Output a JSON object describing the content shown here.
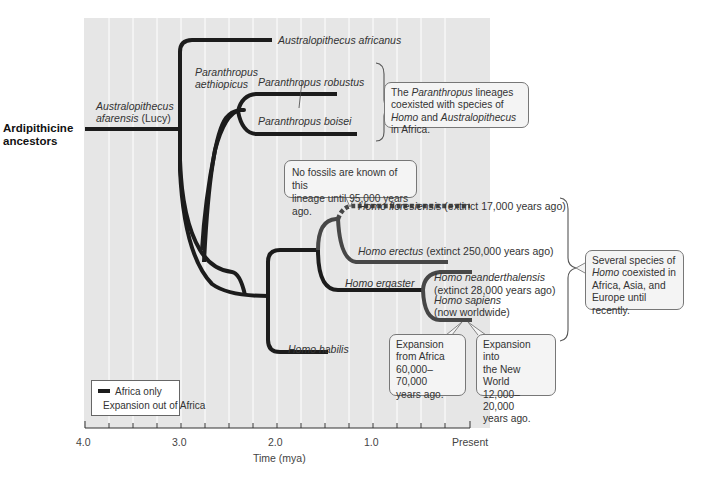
{
  "colors": {
    "background_panel": "#e6e6e6",
    "grid_line": "#ffffff",
    "africa_only": "#1c1c1c",
    "expansion_out_of_africa": "#474747",
    "callout_fill": "#f4f4f4",
    "callout_border": "#777777"
  },
  "root_label": {
    "line1": "Ardipithicine",
    "line2": "ancestors"
  },
  "taxa": {
    "afarensis": {
      "line1": "Australopithecus",
      "line2_italic": "afarensis",
      "line2_plain": " (Lucy)"
    },
    "africanus": "Australopithecus africanus",
    "aethiopicus": {
      "line1": "Paranthropus",
      "line2": "aethiopicus"
    },
    "robustus": "Paranthropus robustus",
    "boisei": "Paranthropus boisei",
    "floresiensis": {
      "name": "Homo floresiensis",
      "note": " (extinct 17,000 years ago)"
    },
    "erectus": {
      "name": "Homo erectus",
      "note": " (extinct 250,000 years ago)"
    },
    "neanderthalensis": {
      "name": "Homo neanderthalensis",
      "note": "(extinct 28,000 years ago)"
    },
    "ergaster": "Homo ergaster",
    "sapiens": {
      "name": "Homo sapiens",
      "note": "(now worldwide)"
    },
    "habilis": "Homo habilis"
  },
  "callouts": {
    "paranthropus": {
      "p1": "The ",
      "p1_it": "Paranthropus",
      "p2": " lineages coexisted with species of ",
      "p2_it": "Homo",
      "p3": " and ",
      "p3_it": "Australopithecus",
      "p4": " in Africa."
    },
    "no_fossils": {
      "line1": "No fossils are known of this",
      "line2": "lineage until 95,000 years ago."
    },
    "homo_coexist": {
      "p1": "Several species of ",
      "p1_it": "Homo",
      "p2": " coexisted in Africa, Asia, and Europe until recently."
    },
    "from_africa": {
      "line1": "Expansion",
      "line2": "from Africa",
      "line3": "60,000–70,000",
      "line4": "years ago."
    },
    "new_world": {
      "line1": "Expansion into",
      "line2": "the New World",
      "line3": "12,000–20,000",
      "line4": "years ago."
    }
  },
  "legend": {
    "items": [
      {
        "label": "Africa only",
        "color": "#1c1c1c"
      },
      {
        "label": "Expansion out of Africa",
        "color": "#474747"
      }
    ]
  },
  "axis": {
    "title": "Time (mya)",
    "ticks": [
      "4.0",
      "3.0",
      "2.0",
      "1.0",
      "Present"
    ]
  }
}
